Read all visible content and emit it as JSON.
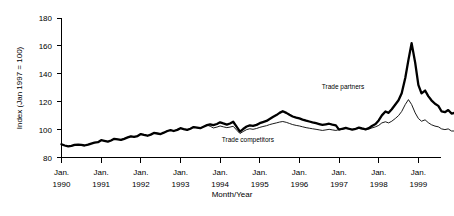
{
  "chart_data": {
    "type": "line",
    "title": "",
    "xlabel": "Month/Year",
    "ylabel": "Index (Jan 1997 = 100)",
    "ylim": [
      80,
      180
    ],
    "yticks": [
      80,
      100,
      120,
      140,
      160,
      180
    ],
    "ytick_labels": [
      "80",
      "100",
      "120",
      "140",
      "160",
      "180"
    ],
    "xlim": [
      1990.0,
      1999.5
    ],
    "xticks": [
      1990,
      1991,
      1992,
      1993,
      1994,
      1995,
      1996,
      1997,
      1998,
      1999
    ],
    "xtick_labels": [
      {
        "month": "Jan.",
        "year": "1990"
      },
      {
        "month": "Jan.",
        "year": "1991"
      },
      {
        "month": "Jan.",
        "year": "1992"
      },
      {
        "month": "Jan.",
        "year": "1993"
      },
      {
        "month": "Jan.",
        "year": "1994"
      },
      {
        "month": "Jan.",
        "year": "1995"
      },
      {
        "month": "Jan.",
        "year": "1996"
      },
      {
        "month": "Jan.",
        "year": "1997"
      },
      {
        "month": "Jan.",
        "year": "1998"
      },
      {
        "month": "Jan.",
        "year": "1999"
      }
    ],
    "grid": false,
    "legend": "inline-annotations",
    "annotations": [
      {
        "text": "Trade partners",
        "x": 1997.1,
        "y": 129,
        "series": "Trade partners"
      },
      {
        "text": "Trade competitors",
        "x": 1994.7,
        "y": 91,
        "series": "Trade competitors"
      }
    ],
    "series": [
      {
        "name": "Trade partners",
        "style": "thick",
        "color": "#000000",
        "x": [
          1990.0,
          1990.08,
          1990.17,
          1990.25,
          1990.33,
          1990.42,
          1990.5,
          1990.58,
          1990.67,
          1990.75,
          1990.83,
          1990.92,
          1991.0,
          1991.08,
          1991.17,
          1991.25,
          1991.33,
          1991.42,
          1991.5,
          1991.58,
          1991.67,
          1991.75,
          1991.83,
          1991.92,
          1992.0,
          1992.08,
          1992.17,
          1992.25,
          1992.33,
          1992.42,
          1992.5,
          1992.58,
          1992.67,
          1992.75,
          1992.83,
          1992.92,
          1993.0,
          1993.08,
          1993.17,
          1993.25,
          1993.33,
          1993.42,
          1993.5,
          1993.58,
          1993.67,
          1993.75,
          1993.83,
          1993.92,
          1994.0,
          1994.08,
          1994.17,
          1994.25,
          1994.33,
          1994.42,
          1994.5,
          1994.58,
          1994.67,
          1994.75,
          1994.83,
          1994.92,
          1995.0,
          1995.08,
          1995.17,
          1995.25,
          1995.33,
          1995.42,
          1995.5,
          1995.58,
          1995.67,
          1995.75,
          1995.83,
          1995.92,
          1996.0,
          1996.08,
          1996.17,
          1996.25,
          1996.33,
          1996.42,
          1996.5,
          1996.58,
          1996.67,
          1996.75,
          1996.83,
          1996.92,
          1997.0,
          1997.08,
          1997.17,
          1997.25,
          1997.33,
          1997.42,
          1997.5,
          1997.58,
          1997.67,
          1997.75,
          1997.83,
          1997.92,
          1998.0,
          1998.08,
          1998.17,
          1998.25,
          1998.33,
          1998.42,
          1998.5,
          1998.58,
          1998.67,
          1998.75,
          1998.83,
          1998.92,
          1999.0,
          1999.08,
          1999.17,
          1999.25,
          1999.33,
          1999.42
        ],
        "values": [
          89.5,
          88.6,
          88.0,
          88.3,
          89.0,
          89.3,
          89.0,
          88.6,
          89.2,
          90.0,
          90.6,
          91.0,
          92.4,
          92.0,
          91.4,
          92.2,
          93.4,
          93.0,
          92.6,
          93.4,
          94.4,
          95.2,
          94.8,
          95.4,
          96.8,
          96.2,
          95.6,
          96.4,
          97.6,
          97.2,
          96.8,
          97.8,
          99.0,
          99.6,
          99.0,
          99.8,
          101.0,
          100.4,
          99.8,
          100.6,
          101.8,
          101.4,
          101.0,
          102.0,
          103.2,
          103.8,
          103.2,
          104.0,
          105.2,
          104.4,
          103.6,
          104.4,
          105.6,
          102.0,
          98.6,
          100.4,
          102.2,
          103.0,
          102.6,
          103.4,
          104.6,
          105.4,
          106.2,
          107.6,
          109.0,
          110.4,
          112.0,
          113.2,
          112.0,
          110.6,
          109.4,
          108.6,
          108.0,
          107.2,
          106.4,
          105.8,
          105.2,
          104.6,
          104.0,
          103.4,
          103.8,
          104.2,
          103.6,
          103.0,
          100.0,
          100.6,
          101.2,
          100.6,
          100.0,
          100.6,
          101.4,
          100.8,
          100.2,
          101.0,
          102.6,
          104.0,
          106.6,
          110.2,
          113.0,
          112.0,
          114.6,
          118.0,
          121.0,
          126.0,
          137.0,
          150.0,
          162.0,
          148.0,
          132.0,
          126.0,
          128.0,
          124.0,
          121.0,
          118.5
        ],
        "values_tail": [
          117.0,
          113.0,
          112.5,
          114.0,
          111.5,
          112.0
        ]
      },
      {
        "name": "Trade competitors",
        "style": "thin",
        "color": "#000000",
        "x": [
          1990.0,
          1990.08,
          1990.17,
          1990.25,
          1990.33,
          1990.42,
          1990.5,
          1990.58,
          1990.67,
          1990.75,
          1990.83,
          1990.92,
          1991.0,
          1991.08,
          1991.17,
          1991.25,
          1991.33,
          1991.42,
          1991.5,
          1991.58,
          1991.67,
          1991.75,
          1991.83,
          1991.92,
          1992.0,
          1992.08,
          1992.17,
          1992.25,
          1992.33,
          1992.42,
          1992.5,
          1992.58,
          1992.67,
          1992.75,
          1992.83,
          1992.92,
          1993.0,
          1993.08,
          1993.17,
          1993.25,
          1993.33,
          1993.42,
          1993.5,
          1993.58,
          1993.67,
          1993.75,
          1993.83,
          1993.92,
          1994.0,
          1994.08,
          1994.17,
          1994.25,
          1994.33,
          1994.42,
          1994.5,
          1994.58,
          1994.67,
          1994.75,
          1994.83,
          1994.92,
          1995.0,
          1995.08,
          1995.17,
          1995.25,
          1995.33,
          1995.42,
          1995.5,
          1995.58,
          1995.67,
          1995.75,
          1995.83,
          1995.92,
          1996.0,
          1996.08,
          1996.17,
          1996.25,
          1996.33,
          1996.42,
          1996.5,
          1996.58,
          1996.67,
          1996.75,
          1996.83,
          1996.92,
          1997.0,
          1997.08,
          1997.17,
          1997.25,
          1997.33,
          1997.42,
          1997.5,
          1997.58,
          1997.67,
          1997.75,
          1997.83,
          1997.92,
          1998.0,
          1998.08,
          1998.17,
          1998.25,
          1998.33,
          1998.42,
          1998.5,
          1998.58,
          1998.67,
          1998.75,
          1998.83,
          1998.92,
          1999.0,
          1999.08,
          1999.17,
          1999.25,
          1999.33,
          1999.42
        ],
        "values": [
          89.5,
          88.6,
          88.0,
          88.3,
          89.0,
          89.3,
          89.0,
          88.6,
          89.2,
          90.0,
          90.6,
          91.0,
          92.4,
          92.0,
          91.4,
          92.2,
          93.4,
          93.0,
          92.6,
          93.4,
          94.4,
          95.2,
          94.8,
          95.4,
          96.8,
          96.2,
          95.6,
          96.4,
          97.6,
          97.2,
          96.8,
          97.8,
          99.0,
          99.6,
          99.0,
          99.8,
          101.0,
          100.4,
          99.8,
          100.6,
          101.8,
          101.4,
          101.0,
          102.0,
          103.2,
          102.4,
          101.2,
          101.8,
          102.6,
          102.0,
          101.4,
          101.8,
          102.4,
          99.6,
          97.2,
          98.6,
          100.0,
          100.6,
          100.2,
          100.8,
          101.6,
          102.2,
          102.8,
          103.6,
          104.2,
          104.8,
          105.4,
          105.8,
          105.2,
          104.4,
          103.6,
          103.0,
          102.6,
          102.0,
          101.4,
          101.0,
          100.6,
          100.2,
          99.8,
          99.4,
          99.8,
          100.2,
          99.8,
          99.4,
          100.0,
          100.4,
          100.8,
          100.4,
          100.0,
          100.4,
          100.8,
          100.4,
          100.0,
          100.4,
          101.2,
          102.0,
          103.0,
          104.8,
          105.6,
          104.8,
          106.0,
          108.0,
          110.0,
          113.0,
          118.0,
          121.5,
          118.0,
          112.0,
          108.0,
          106.0,
          107.0,
          105.0,
          103.5,
          102.5
        ],
        "values_tail": [
          102.0,
          100.5,
          100.0,
          100.5,
          99.0,
          99.0
        ]
      }
    ]
  }
}
